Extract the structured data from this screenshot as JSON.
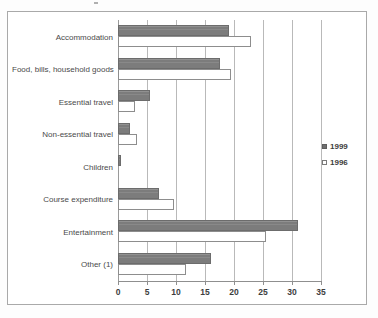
{
  "chart_data": {
    "type": "bar",
    "orientation": "horizontal",
    "title": "",
    "subtitle": "",
    "xlabel": "",
    "ylabel": "",
    "xlim": [
      0,
      35
    ],
    "ylim": null,
    "grid": true,
    "grid_axis": "x",
    "legend_position": "right",
    "categories": [
      "Accommodation",
      "Food, bills, household goods",
      "Essential travel",
      "Non-essential travel",
      "Children",
      "Course expenditure",
      "Entertainment",
      "Other (1)"
    ],
    "xticks": [
      0,
      5,
      10,
      15,
      20,
      25,
      30,
      35
    ],
    "xticklabels": [
      "0",
      "5",
      "10",
      "15",
      "20",
      "25",
      "30",
      "35"
    ],
    "series": [
      {
        "name": "1999",
        "color": "#7c7c7c",
        "style": "filled",
        "values": [
          19.2,
          17.5,
          5.5,
          2.1,
          0.5,
          7.0,
          31.0,
          16.0
        ]
      },
      {
        "name": "1996",
        "color": "#ffffff",
        "style": "hollow",
        "values": [
          23.0,
          19.5,
          3.0,
          3.3,
          0.0,
          9.7,
          25.6,
          11.8
        ]
      }
    ]
  },
  "legend": {
    "entries": [
      {
        "label": "1999",
        "marker": "filled-square"
      },
      {
        "label": "1996",
        "marker": "hollow-square"
      }
    ]
  },
  "colors": {
    "series_1999": "#7c7c7c",
    "series_1996": "#ffffff",
    "gridline": "#b9b9b9",
    "axis": "#8f8f8f",
    "frame": "#a9a9a9",
    "text": "#4a4a4a",
    "background": "#ffffff"
  }
}
